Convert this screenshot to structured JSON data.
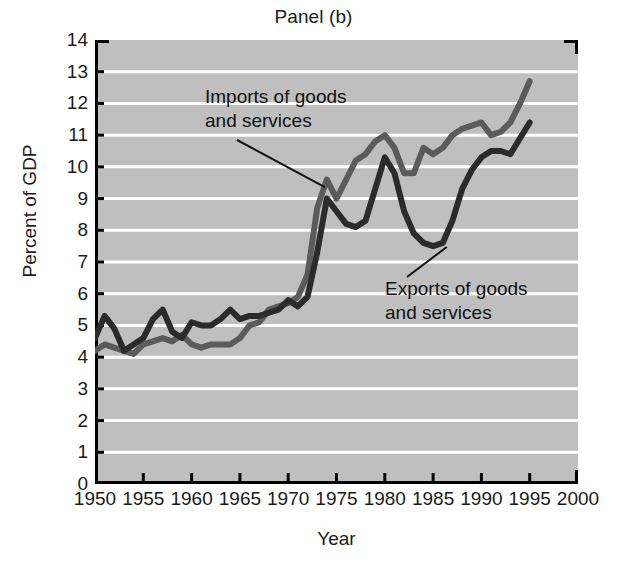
{
  "chart_data": {
    "type": "line",
    "title": "Panel (b)",
    "xlabel": "Year",
    "ylabel": "Percent of GDP",
    "xlim": [
      1950,
      2000
    ],
    "ylim": [
      0,
      14
    ],
    "xticks": [
      1950,
      1955,
      1960,
      1965,
      1970,
      1975,
      1980,
      1985,
      1990,
      1995,
      2000
    ],
    "yticks": [
      0,
      1,
      2,
      3,
      4,
      5,
      6,
      7,
      8,
      9,
      10,
      11,
      12,
      13,
      14
    ],
    "grid": "horizontal-white",
    "background": "#bfbfbf",
    "legend": "inline-annotations",
    "annotations": [
      {
        "text_line1": "Imports of goods",
        "text_line2": "and services",
        "points_to_year": 1974,
        "points_to_value": 9.3
      },
      {
        "text_line1": "Exports of goods",
        "text_line2": "and services",
        "points_to_year": 1986,
        "points_to_value": 7.6
      }
    ],
    "x": [
      1950,
      1951,
      1952,
      1953,
      1954,
      1955,
      1956,
      1957,
      1958,
      1959,
      1960,
      1961,
      1962,
      1963,
      1964,
      1965,
      1966,
      1967,
      1968,
      1969,
      1970,
      1971,
      1972,
      1973,
      1974,
      1975,
      1976,
      1977,
      1978,
      1979,
      1980,
      1981,
      1982,
      1983,
      1984,
      1985,
      1986,
      1987,
      1988,
      1989,
      1990,
      1991,
      1992,
      1993,
      1994,
      1995
    ],
    "series": [
      {
        "name": "Imports of goods and services",
        "color": "#5b5b5b",
        "values": [
          4.2,
          4.4,
          4.3,
          4.2,
          4.1,
          4.4,
          4.5,
          4.6,
          4.5,
          4.7,
          4.4,
          4.3,
          4.4,
          4.4,
          4.4,
          4.6,
          5.0,
          5.1,
          5.5,
          5.6,
          5.7,
          5.9,
          6.6,
          8.7,
          9.6,
          9.0,
          9.6,
          10.2,
          10.4,
          10.8,
          11.0,
          10.6,
          9.8,
          9.8,
          10.6,
          10.4,
          10.6,
          11.0,
          11.2,
          11.3,
          11.4,
          11.0,
          11.1,
          11.4,
          12.0,
          12.7
        ]
      },
      {
        "name": "Exports of goods and services",
        "color": "#2b2b2b",
        "values": [
          4.6,
          5.3,
          4.9,
          4.2,
          4.4,
          4.6,
          5.2,
          5.5,
          4.8,
          4.6,
          5.1,
          5.0,
          5.0,
          5.2,
          5.5,
          5.2,
          5.3,
          5.3,
          5.4,
          5.5,
          5.8,
          5.6,
          5.9,
          7.3,
          9.0,
          8.6,
          8.2,
          8.1,
          8.3,
          9.3,
          10.3,
          9.8,
          8.6,
          7.9,
          7.6,
          7.5,
          7.6,
          8.3,
          9.3,
          9.9,
          10.3,
          10.5,
          10.5,
          10.4,
          10.9,
          11.4
        ]
      }
    ]
  },
  "figure": {
    "title": "Panel (b)",
    "x_axis_title": "Year",
    "y_axis_title": "Percent of GDP"
  }
}
